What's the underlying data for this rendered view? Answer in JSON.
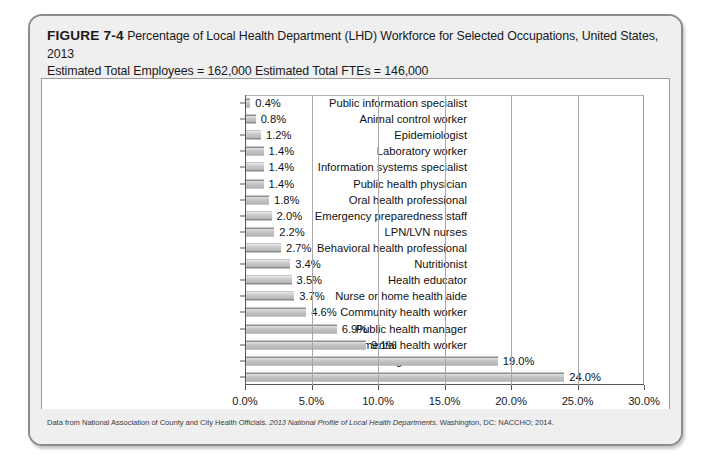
{
  "figure": {
    "number_label": "FIGURE 7-4",
    "caption_line1": "Percentage of Local Health Department (LHD) Workforce for Selected Occupations, United States, 2013",
    "caption_line2": "Estimated Total Employees = 162,000 Estimated Total FTEs = 146,000",
    "source_prefix": "Data from National Association of County and City Health Officials. ",
    "source_italic": "2013 National Profile of Local Health Departments",
    "source_suffix": ". Washington, DC: NACCHO; 2014."
  },
  "chart_data": {
    "type": "bar",
    "orientation": "horizontal",
    "title": "Percentage of Local Health Department (LHD) Workforce for Selected Occupations, United States, 2013",
    "xlabel": "",
    "ylabel": "",
    "xlim": [
      0,
      30
    ],
    "grid": true,
    "legend": "none",
    "bar_color": "#c4c4c4",
    "bar_edge_color": "#8a8a8a",
    "tick_labels": [
      "0.0%",
      "5.0%",
      "10.0%",
      "15.0%",
      "20.0%",
      "25.0%",
      "30.0%"
    ],
    "tick_values": [
      0,
      5,
      10,
      15,
      20,
      25,
      30
    ],
    "categories": [
      "Public information specialist",
      "Animal control worker",
      "Epidemiologist",
      "Laboratory worker",
      "Information systems specialist",
      "Public health physician",
      "Oral health professional",
      "Emergency preparedness staff",
      "LPN/LVN nurses",
      "Behavioral health professional",
      "Nutritionist",
      "Health educator",
      "Nurse or home health aide",
      "Community health worker",
      "Public health manager",
      "Environmental health worker",
      "Registered nurse",
      "Administrative/clerical staff"
    ],
    "values": [
      0.4,
      0.8,
      1.2,
      1.4,
      1.4,
      1.4,
      1.8,
      2.0,
      2.2,
      2.7,
      3.4,
      3.5,
      3.7,
      4.6,
      6.9,
      9.1,
      19.0,
      24.0
    ],
    "value_labels": [
      "0.4%",
      "0.8%",
      "1.2%",
      "1.4%",
      "1.4%",
      "1.4%",
      "1.8%",
      "2.0%",
      "2.2%",
      "2.7%",
      "3.4%",
      "3.5%",
      "3.7%",
      "4.6%",
      "6.9%",
      "9.1%",
      "19.0%",
      "24.0%"
    ]
  }
}
